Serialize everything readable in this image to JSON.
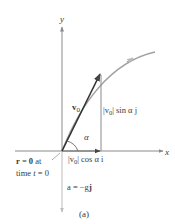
{
  "figure": {
    "caption": "(a)",
    "axes": {
      "x_label": "x",
      "y_label": "y"
    },
    "vectors": {
      "v0": {
        "label": "v",
        "subscript": "0"
      },
      "vertical_component": {
        "label_abs": "|v",
        "label_sub": "0",
        "label_rest": "| sin α j"
      },
      "horizontal_component": {
        "label_abs": "|v",
        "label_sub": "0",
        "label_rest": "| cos α i"
      },
      "acceleration": {
        "label": "a = −g",
        "label_j": "j"
      }
    },
    "angle_label": "α",
    "origin_note": {
      "line1_r": "r",
      "line1_rest": " = ",
      "line1_zero": "0",
      "line1_at": " at",
      "line2": "time ",
      "line2_t": "t",
      "line2_end": " = 0"
    },
    "colors": {
      "axis": "#8a8a8a",
      "vector": "#333333",
      "curve": "#9a9a9a",
      "text": "#3a3a3a"
    }
  }
}
